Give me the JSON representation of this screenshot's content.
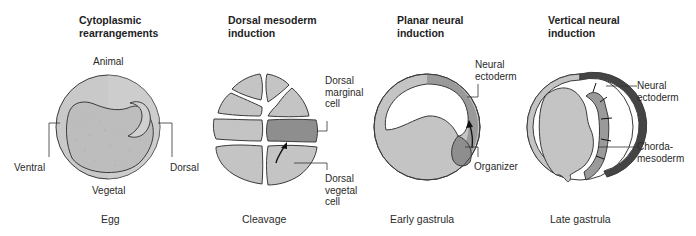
{
  "panels": [
    {
      "title_line1": "Cytoplasmic",
      "title_line2": "rearrangements",
      "stage": "Egg",
      "labels": {
        "top": "Animal",
        "bottom": "Vegetal",
        "left": "Ventral",
        "right": "Dorsal"
      }
    },
    {
      "title_line1": "Dorsal mesoderm",
      "title_line2": "induction",
      "stage": "Cleavage",
      "labels": {
        "marginal": [
          "Dorsal",
          "marginal",
          "cell"
        ],
        "vegetal": [
          "Dorsal",
          "vegetal",
          "cell"
        ]
      }
    },
    {
      "title_line1": "Planar neural",
      "title_line2": "induction",
      "stage": "Early gastrula",
      "labels": {
        "ectoderm": [
          "Neural",
          "ectoderm"
        ],
        "organizer": "Organizer"
      }
    },
    {
      "title_line1": "Vertical neural",
      "title_line2": "induction",
      "stage": "Late gastrula",
      "labels": {
        "ectoderm": [
          "Neural",
          "ectoderm"
        ],
        "mesoderm": [
          "Chorda-",
          "mesoderm"
        ]
      }
    }
  ],
  "colors": {
    "light_fill": "#c4c4c4",
    "mid_fill": "#9a9a9a",
    "dark_fill": "#4a4a4a",
    "outline": "#3a3a3a"
  }
}
